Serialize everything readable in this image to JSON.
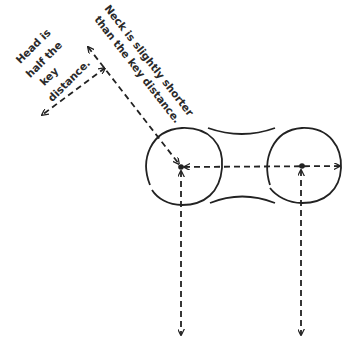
{
  "diagram": {
    "type": "proportion-sketch",
    "stroke_color": "#222222",
    "labels": {
      "head": [
        "Head is",
        "half the",
        "key",
        "distance."
      ],
      "neck": [
        "Neck is slightly shorter",
        "than the key distance."
      ]
    },
    "shapes": {
      "left_circle": {
        "cx": 184,
        "cy": 166,
        "r": 38
      },
      "right_circle": {
        "cx": 304,
        "cy": 166,
        "r": 37
      },
      "neck_curves": "top and bottom concave connectors between circles"
    },
    "arrows": [
      {
        "name": "head-arrow",
        "from": [
          105,
          68
        ],
        "to": [
          42,
          115
        ],
        "heads": "both"
      },
      {
        "name": "neck-arrow",
        "from": [
          88,
          47
        ],
        "to": [
          179,
          164
        ],
        "heads": "both"
      },
      {
        "name": "key-distance-arrow",
        "from": [
          182,
          166
        ],
        "to": [
          340,
          166
        ],
        "heads": "both"
      },
      {
        "name": "left-vertical-arrow",
        "from": [
          181,
          170
        ],
        "to": [
          181,
          335
        ],
        "heads": "both"
      },
      {
        "name": "right-vertical-arrow",
        "from": [
          301,
          170
        ],
        "to": [
          301,
          335
        ],
        "heads": "both"
      }
    ]
  }
}
